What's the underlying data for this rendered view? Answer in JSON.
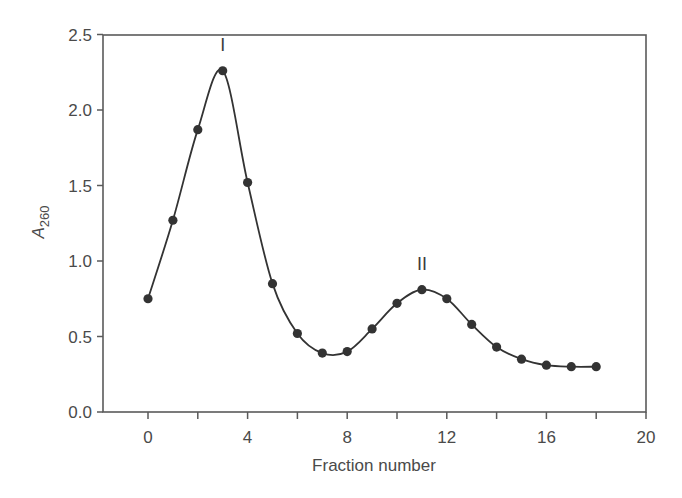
{
  "chart_data": {
    "type": "line",
    "title": "",
    "xlabel": "Fraction number",
    "ylabel": "A",
    "ylabel_subscript": "260",
    "xlim": [
      -1.8,
      20
    ],
    "ylim": [
      0,
      2.5
    ],
    "x_ticks": [
      0,
      4,
      8,
      12,
      16,
      20
    ],
    "x_minor_ticks": [
      2,
      6,
      10,
      14,
      18
    ],
    "y_ticks": [
      0.0,
      0.5,
      1.0,
      1.5,
      2.0,
      2.5
    ],
    "x_tick_labels": [
      "0",
      "4",
      "8",
      "12",
      "16",
      "20"
    ],
    "y_tick_labels": [
      "0.0",
      "0.5",
      "1.0",
      "1.5",
      "2.0",
      "2.5"
    ],
    "grid": false,
    "legend": null,
    "series": [
      {
        "name": "A260",
        "x": [
          0,
          1,
          2,
          3,
          4,
          5,
          6,
          7,
          8,
          9,
          10,
          11,
          12,
          13,
          14,
          15,
          16,
          17,
          18
        ],
        "values": [
          0.75,
          1.27,
          1.87,
          2.26,
          1.52,
          0.85,
          0.52,
          0.39,
          0.4,
          0.55,
          0.72,
          0.81,
          0.75,
          0.58,
          0.43,
          0.35,
          0.31,
          0.3,
          0.3
        ],
        "marker": "circle",
        "smooth": true,
        "color": "#333333"
      }
    ],
    "annotations": [
      {
        "text": "I",
        "x": 3,
        "y": 2.26
      },
      {
        "text": "II",
        "x": 11,
        "y": 0.81
      }
    ]
  }
}
